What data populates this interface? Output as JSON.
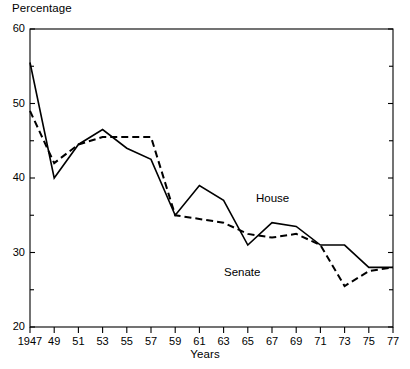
{
  "chart_data": {
    "type": "line",
    "title": "",
    "ylabel": "Percentage",
    "xlabel": "Years",
    "xlim": [
      1947,
      1977
    ],
    "ylim": [
      20,
      60
    ],
    "yticks": [
      20,
      30,
      40,
      50,
      60
    ],
    "yticks_minor": [
      25,
      35,
      45,
      55
    ],
    "ytick_labels": [
      "20",
      "30",
      "40",
      "50",
      "60"
    ],
    "grid": false,
    "legend_position": "inline-annotation",
    "x": [
      1947,
      1949,
      1951,
      1953,
      1955,
      1957,
      1959,
      1961,
      1963,
      1965,
      1967,
      1969,
      1971,
      1973,
      1975,
      1977
    ],
    "xtick_labels": [
      "1947",
      "49",
      "51",
      "53",
      "55",
      "57",
      "59",
      "61",
      "63",
      "65",
      "67",
      "69",
      "71",
      "73",
      "75",
      "77"
    ],
    "series": [
      {
        "name": "House",
        "style": "solid",
        "color": "#000000",
        "values": [
          55.5,
          40.0,
          44.5,
          46.5,
          44.0,
          42.5,
          35.0,
          39.0,
          37.0,
          31.0,
          34.0,
          33.5,
          31.0,
          31.0,
          28.0,
          28.0
        ]
      },
      {
        "name": "Senate",
        "style": "dashed",
        "color": "#000000",
        "values": [
          49.0,
          42.0,
          44.5,
          45.5,
          45.5,
          45.5,
          35.0,
          34.5,
          34.0,
          32.5,
          32.0,
          32.5,
          31.0,
          25.5,
          27.5,
          28.0
        ]
      }
    ],
    "annotations": [
      {
        "text": "House",
        "x": 1967,
        "y": 36.5
      },
      {
        "text": "Senate",
        "x": 1964,
        "y": 28.5
      }
    ]
  }
}
